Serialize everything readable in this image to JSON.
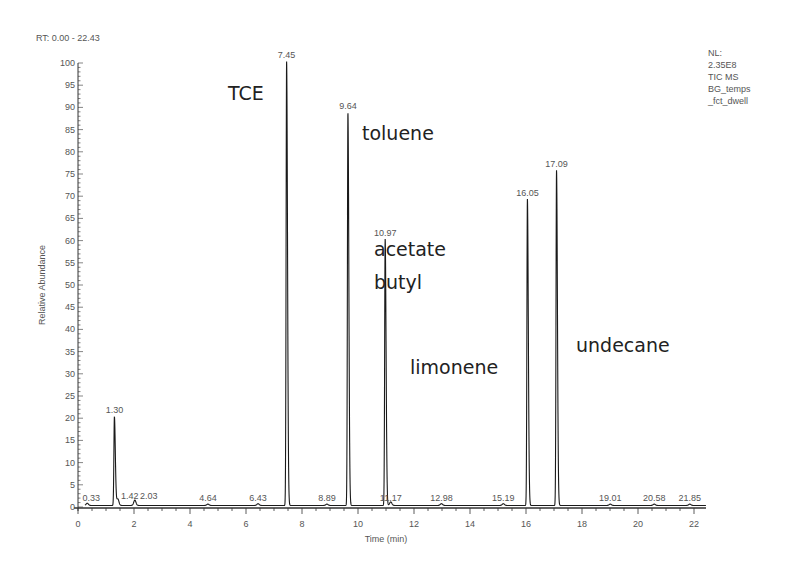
{
  "header": {
    "rt_range": "RT: 0.00 - 22.43",
    "info_lines": [
      "NL:",
      "2.35E8",
      "TIC  MS",
      "BG_temps",
      "_fct_dwell"
    ]
  },
  "chart_data": {
    "type": "line",
    "title": "RT: 0.00 - 22.43",
    "subtitle": "NL: 2.35E8 TIC MS BG_temps_fct_dwell",
    "xlabel": "Time (min)",
    "ylabel": "Relative Abundance",
    "xlim": [
      0,
      22.43
    ],
    "ylim": [
      0,
      100
    ],
    "x_ticks": [
      0,
      2,
      4,
      6,
      8,
      10,
      12,
      14,
      16,
      18,
      20,
      22
    ],
    "y_ticks": [
      0,
      5,
      10,
      15,
      20,
      25,
      30,
      35,
      40,
      45,
      50,
      55,
      60,
      65,
      70,
      75,
      80,
      85,
      90,
      95,
      100
    ],
    "grid": false,
    "legend": null,
    "peaks": [
      {
        "rt": 0.33,
        "label": "0.33",
        "abundance": 0.5,
        "compound": ""
      },
      {
        "rt": 1.3,
        "label": "1.30",
        "abundance": 20,
        "compound": ""
      },
      {
        "rt": 1.42,
        "label": "1.42",
        "abundance": 1.5,
        "compound": ""
      },
      {
        "rt": 2.03,
        "label": "2.03",
        "abundance": 1.2,
        "compound": ""
      },
      {
        "rt": 4.64,
        "label": "4.64",
        "abundance": 0.3,
        "compound": ""
      },
      {
        "rt": 6.43,
        "label": "6.43",
        "abundance": 0.4,
        "compound": ""
      },
      {
        "rt": 7.45,
        "label": "7.45",
        "abundance": 100,
        "compound": "TCE"
      },
      {
        "rt": 8.89,
        "label": "8.89",
        "abundance": 0.3,
        "compound": ""
      },
      {
        "rt": 9.64,
        "label": "9.64",
        "abundance": 88.5,
        "compound": "toluene"
      },
      {
        "rt": 10.97,
        "label": "10.97",
        "abundance": 60,
        "compound": "acetate butyl"
      },
      {
        "rt": 11.17,
        "label": "11.17",
        "abundance": 0.8,
        "compound": ""
      },
      {
        "rt": 12.98,
        "label": "12.98",
        "abundance": 0.4,
        "compound": ""
      },
      {
        "rt": 15.19,
        "label": "15.19",
        "abundance": 0.4,
        "compound": ""
      },
      {
        "rt": 16.05,
        "label": "16.05",
        "abundance": 69,
        "compound": "limonene"
      },
      {
        "rt": 17.09,
        "label": "17.09",
        "abundance": 75.5,
        "compound": "undecane"
      },
      {
        "rt": 19.01,
        "label": "19.01",
        "abundance": 0.3,
        "compound": ""
      },
      {
        "rt": 20.58,
        "label": "20.58",
        "abundance": 0.3,
        "compound": ""
      },
      {
        "rt": 21.85,
        "label": "21.85",
        "abundance": 0.3,
        "compound": ""
      }
    ],
    "annotations": [
      {
        "text": "TCE",
        "x_px": 228,
        "y_px": 100
      },
      {
        "text": "toluene",
        "x_px": 362,
        "y_px": 140
      },
      {
        "text": "acetate",
        "x_px": 374,
        "y_px": 256
      },
      {
        "text": "butyl",
        "x_px": 374,
        "y_px": 289
      },
      {
        "text": "limonene",
        "x_px": 410,
        "y_px": 374
      },
      {
        "text": "undecane",
        "x_px": 576,
        "y_px": 352
      }
    ]
  },
  "colors": {
    "trace": "#1a1a1a",
    "axis": "#333333",
    "text": "#555555"
  }
}
